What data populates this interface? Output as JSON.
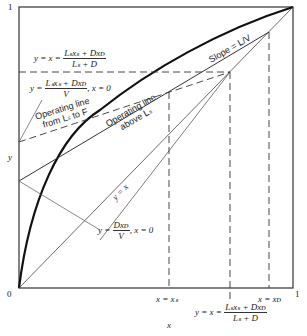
{
  "axes": {
    "y_top_tick": "1",
    "x_origin": "0",
    "x_right_tick": "1",
    "x_label": "x",
    "y_label": "y"
  },
  "labels": {
    "feed_intersection": {
      "lhs": "y = x =",
      "num": "Lₛxₛ + Dxᴅ",
      "den": "Lₛ + D"
    },
    "upper_intercept": {
      "lhs": "y =",
      "num": "Lₛxₛ + Dxᴅ",
      "den": "V",
      "tail": ", x = 0"
    },
    "op_line_lower_1": "Operating line",
    "op_line_lower_2": "from Lₛ to F",
    "op_line_upper_1": "Operating line",
    "op_line_upper_2": "above Lₛ",
    "slope": "Slope = L/V",
    "diagonal": "y = x",
    "lower_intercept": {
      "lhs": "y =",
      "num": "Dxᴅ",
      "den": "V",
      "tail": ", x = 0"
    },
    "x_xs": "x = xₛ",
    "x_xd": "x = xᴅ",
    "bottom_intersection": {
      "lhs": "y = x =",
      "num": "Lₛxₛ + Dxᴅ",
      "den": "Lₛ + D"
    }
  },
  "colors": {
    "frame": "#333333",
    "curve": "#111111",
    "line": "#444444"
  }
}
